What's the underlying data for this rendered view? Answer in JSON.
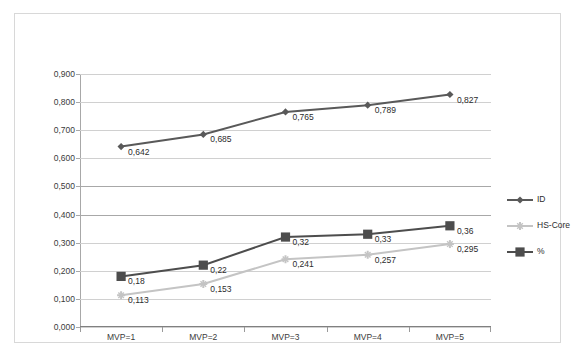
{
  "chart_data": {
    "type": "line",
    "title": "",
    "xlabel": "",
    "ylabel": "",
    "categories": [
      "MVP=1",
      "MVP=2",
      "MVP=3",
      "MVP=4",
      "MVP=5"
    ],
    "ylim": [
      0.0,
      0.9
    ],
    "ytick_labels": [
      "0,000",
      "0,100",
      "0,200",
      "0,300",
      "0,400",
      "0,500",
      "0,600",
      "0,700",
      "0,800",
      "0,900"
    ],
    "ytick_values": [
      0.0,
      0.1,
      0.2,
      0.3,
      0.4,
      0.5,
      0.6,
      0.7,
      0.8,
      0.9
    ],
    "grid": true,
    "legend_position": "right",
    "series": [
      {
        "name": "ID",
        "color": "#595959",
        "marker": "diamond",
        "values": [
          0.642,
          0.685,
          0.765,
          0.789,
          0.827
        ],
        "labels": [
          "0,642",
          "0,685",
          "0,765",
          "0,789",
          "0,827"
        ]
      },
      {
        "name": "HS-Core",
        "color": "#c4c4c4",
        "marker": "star",
        "values": [
          0.113,
          0.153,
          0.241,
          0.257,
          0.295
        ],
        "labels": [
          "0,113",
          "0,153",
          "0,241",
          "0,257",
          "0,295"
        ]
      },
      {
        "name": "%",
        "color": "#4d4d4d",
        "marker": "square",
        "values": [
          0.18,
          0.22,
          0.32,
          0.33,
          0.36
        ],
        "labels": [
          "0,18",
          "0,22",
          "0,32",
          "0,33",
          "0,36"
        ]
      }
    ]
  }
}
